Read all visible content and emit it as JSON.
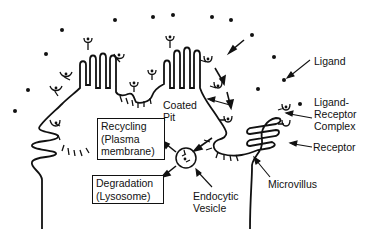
{
  "diagram": {
    "type": "receptor-mediated endocytosis schematic",
    "labels": {
      "ligand": "Ligand",
      "ligand_receptor_complex_1": "Ligand-",
      "ligand_receptor_complex_2": "Receptor",
      "ligand_receptor_complex_3": "Complex",
      "receptor": "Receptor",
      "coated_pit_1": "Coated",
      "coated_pit_2": "Pit",
      "microvillus": "Microvillus",
      "endocytic_vesicle_1": "Endocytic",
      "endocytic_vesicle_2": "Vesicle"
    },
    "boxes": {
      "recycling_1": "Recycling",
      "recycling_2": "(Plasma",
      "recycling_3": "membrane)",
      "degradation_1": "Degradation",
      "degradation_2": "(Lysosome)"
    },
    "colors": {
      "ink": "#111111",
      "background": "#ffffff"
    }
  }
}
